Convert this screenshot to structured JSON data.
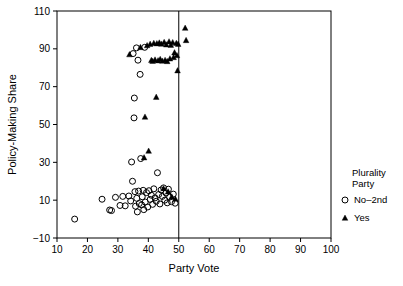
{
  "chart_data": {
    "type": "scatter",
    "title": "",
    "xlabel": "Party Vote",
    "ylabel": "Policy-Making Share",
    "xlim": [
      10,
      100
    ],
    "ylim": [
      -10,
      110
    ],
    "xticks": [
      10,
      20,
      30,
      40,
      50,
      60,
      70,
      80,
      90,
      100
    ],
    "yticks": [
      -10,
      10,
      30,
      50,
      70,
      90,
      110
    ],
    "grid": false,
    "legend": {
      "position": "right-outside",
      "title_line1": "Plurality",
      "title_line2": "Party",
      "entries": [
        {
          "label": "No–2nd",
          "marker": "open-circle",
          "color": "#000000"
        },
        {
          "label": "Yes",
          "marker": "filled-triangle",
          "color": "#000000"
        }
      ]
    },
    "annotations": [
      {
        "type": "vertical-line",
        "x": 50,
        "label": "majority threshold at 50"
      }
    ],
    "series": [
      {
        "name": "No–2nd",
        "marker": "open-circle",
        "points": [
          [
            15.8,
            0.0
          ],
          [
            24.8,
            10.5
          ],
          [
            27.3,
            4.8
          ],
          [
            27.9,
            4.5
          ],
          [
            29.2,
            11.5
          ],
          [
            30.7,
            7.2
          ],
          [
            31.6,
            12.0
          ],
          [
            32.4,
            7.0
          ],
          [
            33.6,
            12.2
          ],
          [
            34.2,
            9.6
          ],
          [
            34.5,
            30.2
          ],
          [
            34.8,
            20.0
          ],
          [
            35.0,
            87.5
          ],
          [
            35.3,
            53.5
          ],
          [
            35.4,
            64.0
          ],
          [
            35.6,
            14.5
          ],
          [
            35.8,
            6.8
          ],
          [
            36.1,
            90.5
          ],
          [
            36.2,
            11.0
          ],
          [
            36.4,
            3.8
          ],
          [
            36.6,
            84.0
          ],
          [
            36.8,
            14.8
          ],
          [
            37.0,
            8.2
          ],
          [
            37.3,
            76.5
          ],
          [
            37.5,
            32.0
          ],
          [
            37.8,
            7.5
          ],
          [
            38.0,
            11.8
          ],
          [
            38.3,
            15.2
          ],
          [
            38.5,
            5.0
          ],
          [
            38.8,
            90.8
          ],
          [
            39.0,
            9.0
          ],
          [
            39.4,
            14.0
          ],
          [
            39.8,
            6.4
          ],
          [
            40.2,
            15.0
          ],
          [
            40.6,
            10.4
          ],
          [
            41.0,
            12.6
          ],
          [
            41.4,
            7.8
          ],
          [
            41.8,
            16.0
          ],
          [
            42.2,
            11.2
          ],
          [
            42.6,
            9.4
          ],
          [
            43.0,
            24.5
          ],
          [
            43.4,
            13.0
          ],
          [
            43.8,
            8.0
          ],
          [
            44.2,
            15.4
          ],
          [
            44.6,
            12.0
          ],
          [
            45.0,
            16.5
          ],
          [
            45.4,
            10.0
          ],
          [
            45.8,
            13.8
          ],
          [
            46.2,
            8.6
          ],
          [
            46.6,
            15.8
          ],
          [
            47.0,
            11.6
          ],
          [
            47.6,
            9.2
          ],
          [
            48.2,
            13.2
          ],
          [
            48.8,
            8.4
          ]
        ]
      },
      {
        "name": "Yes",
        "marker": "filled-triangle",
        "points": [
          [
            33.8,
            87.0
          ],
          [
            37.4,
            90.8
          ],
          [
            38.6,
            32.5
          ],
          [
            38.9,
            54.0
          ],
          [
            39.6,
            91.8
          ],
          [
            40.1,
            36.0
          ],
          [
            40.6,
            92.5
          ],
          [
            41.0,
            84.0
          ],
          [
            41.4,
            83.5
          ],
          [
            41.8,
            93.0
          ],
          [
            42.2,
            84.2
          ],
          [
            42.6,
            64.5
          ],
          [
            42.8,
            92.8
          ],
          [
            43.2,
            83.8
          ],
          [
            43.6,
            93.2
          ],
          [
            43.9,
            84.5
          ],
          [
            44.3,
            92.6
          ],
          [
            44.6,
            83.6
          ],
          [
            45.0,
            16.2
          ],
          [
            45.2,
            93.5
          ],
          [
            45.5,
            84.0
          ],
          [
            45.9,
            92.2
          ],
          [
            46.2,
            83.4
          ],
          [
            46.5,
            14.5
          ],
          [
            46.8,
            93.8
          ],
          [
            47.1,
            84.8
          ],
          [
            47.4,
            92.0
          ],
          [
            47.7,
            11.8
          ],
          [
            48.0,
            93.4
          ],
          [
            48.3,
            85.5
          ],
          [
            48.6,
            88.0
          ],
          [
            48.9,
            10.6
          ],
          [
            49.2,
            93.0
          ],
          [
            49.4,
            86.5
          ],
          [
            49.6,
            78.5
          ],
          [
            49.8,
            92.5
          ],
          [
            52.1,
            101.0
          ],
          [
            52.4,
            94.5
          ]
        ]
      }
    ]
  },
  "geometry": {
    "plot_left": 57,
    "plot_right": 331,
    "plot_top": 11,
    "plot_bottom": 238
  }
}
